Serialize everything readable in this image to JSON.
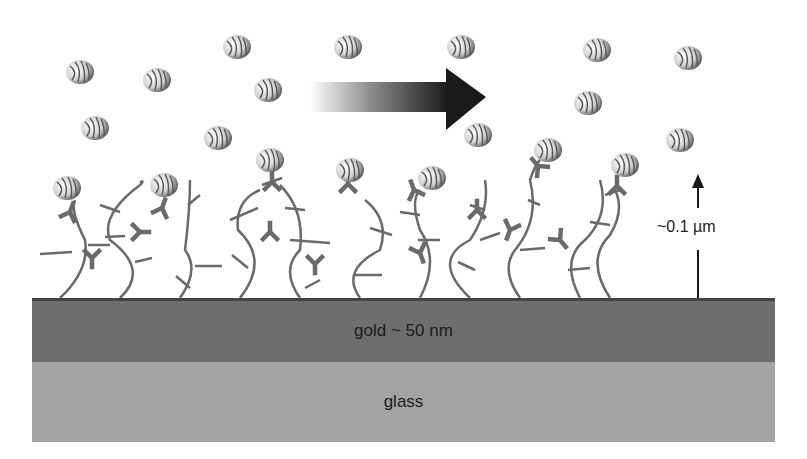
{
  "diagram": {
    "layers": {
      "gold_label": "gold ~ 50 nm",
      "glass_label": "glass"
    },
    "height_annotation": "~0.1 µm",
    "flow_arrow": "flow-direction-arrow",
    "colors": {
      "gold": "#6e6e6e",
      "glass": "#a3a3a3",
      "chains": "#6a6a6a",
      "antibody": "#6a6a6a",
      "arrow_dark": "#1a1a1a"
    },
    "free_particles": [
      [
        80,
        72
      ],
      [
        157,
        80
      ],
      [
        237,
        47
      ],
      [
        268,
        90
      ],
      [
        95,
        128
      ],
      [
        218,
        138
      ],
      [
        348,
        47
      ],
      [
        461,
        47
      ],
      [
        597,
        50
      ],
      [
        688,
        58
      ],
      [
        588,
        103
      ],
      [
        478,
        135
      ],
      [
        405,
        143
      ],
      [
        680,
        140
      ]
    ],
    "bound_particles": [
      [
        67,
        188
      ],
      [
        164,
        185
      ],
      [
        270,
        160
      ],
      [
        350,
        170
      ],
      [
        432,
        178
      ],
      [
        548,
        150
      ],
      [
        625,
        165
      ]
    ]
  }
}
